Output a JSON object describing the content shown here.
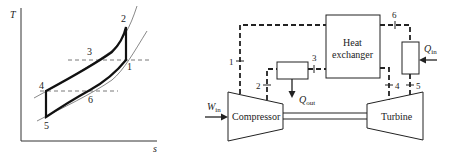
{
  "ts_diagram": {
    "y_axis_label": "T",
    "x_axis_label": "s",
    "points": [
      {
        "id": "1",
        "label": "1"
      },
      {
        "id": "2",
        "label": "2"
      },
      {
        "id": "3",
        "label": "3"
      },
      {
        "id": "4",
        "label": "4"
      },
      {
        "id": "5",
        "label": "5"
      },
      {
        "id": "6",
        "label": "6"
      }
    ]
  },
  "schematic": {
    "compressor_label": "Compressor",
    "turbine_label": "Turbine",
    "heat_exchanger_line1": "Heat",
    "heat_exchanger_line2": "exchanger",
    "work_in": {
      "main": "W",
      "sub": "in"
    },
    "heat_in": {
      "main": "Q",
      "sub": "in"
    },
    "heat_out": {
      "main": "Q",
      "sub": "out"
    },
    "state_labels": [
      "1",
      "2",
      "3",
      "4",
      "5",
      "6"
    ]
  },
  "colors": {
    "line": "#222222",
    "dashed": "#555555",
    "background": "#ffffff"
  }
}
